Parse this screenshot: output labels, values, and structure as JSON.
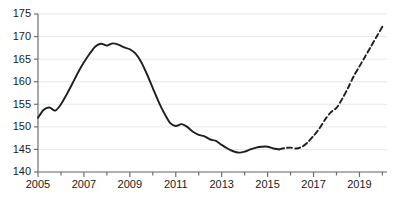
{
  "chart_data": {
    "type": "line",
    "title": "",
    "subtitle": "",
    "xlabel": "",
    "ylabel": "",
    "xlim": [
      2005.0,
      2020.2
    ],
    "ylim": [
      140,
      175
    ],
    "grid": true,
    "legend": "none",
    "y_ticks": [
      140,
      145,
      150,
      155,
      160,
      165,
      170,
      175
    ],
    "y_tick_labels": [
      "140",
      "145",
      "150",
      "155",
      "160",
      "165",
      "170",
      "175"
    ],
    "x_ticks": [
      2005,
      2006,
      2007,
      2008,
      2009,
      2010,
      2011,
      2012,
      2013,
      2014,
      2015,
      2016,
      2017,
      2018,
      2019,
      2020
    ],
    "x_tick_labels_shown": [
      "2005",
      "2007",
      "2009",
      "2011",
      "2013",
      "2015",
      "2017",
      "2019"
    ],
    "x_labeled_ticks": [
      2005,
      2007,
      2009,
      2011,
      2013,
      2015,
      2017,
      2019
    ],
    "line_color": "#1f1f1f",
    "grid_color": "#e8e8e8",
    "axis_color": "#6e6e6e",
    "series": [
      {
        "name": "actual",
        "style": "solid",
        "x": [
          2005.0,
          2005.25,
          2005.5,
          2005.75,
          2006.0,
          2006.25,
          2006.5,
          2006.75,
          2007.0,
          2007.25,
          2007.5,
          2007.75,
          2008.0,
          2008.25,
          2008.5,
          2008.75,
          2009.0,
          2009.25,
          2009.5,
          2009.75,
          2010.0,
          2010.25,
          2010.5,
          2010.75,
          2011.0,
          2011.25,
          2011.5,
          2011.75,
          2012.0,
          2012.25,
          2012.5,
          2012.75,
          2013.0,
          2013.25,
          2013.5,
          2013.75,
          2014.0,
          2014.25,
          2014.5,
          2014.75,
          2015.0,
          2015.25,
          2015.5
        ],
        "y": [
          152.0,
          153.8,
          154.3,
          153.6,
          155.0,
          157.2,
          159.6,
          162.1,
          164.3,
          166.2,
          167.8,
          168.4,
          168.0,
          168.5,
          168.2,
          167.6,
          167.2,
          166.2,
          164.3,
          161.6,
          158.6,
          155.6,
          153.0,
          150.9,
          150.2,
          150.6,
          150.0,
          148.9,
          148.2,
          147.9,
          147.2,
          146.9,
          146.0,
          145.2,
          144.6,
          144.3,
          144.5,
          145.0,
          145.4,
          145.6,
          145.6,
          145.2,
          145.0
        ]
      },
      {
        "name": "forecast",
        "style": "dashed",
        "x": [
          2015.5,
          2015.75,
          2016.0,
          2016.25,
          2016.5,
          2016.75,
          2017.0,
          2017.25,
          2017.5,
          2017.75,
          2018.0,
          2018.25,
          2018.5,
          2018.75,
          2019.0,
          2019.25,
          2019.5,
          2019.75,
          2020.0
        ],
        "y": [
          145.0,
          145.3,
          145.4,
          145.2,
          145.6,
          146.6,
          148.0,
          149.6,
          151.6,
          153.2,
          154.2,
          156.2,
          158.6,
          161.2,
          163.4,
          165.6,
          167.8,
          170.0,
          172.2
        ]
      }
    ]
  }
}
